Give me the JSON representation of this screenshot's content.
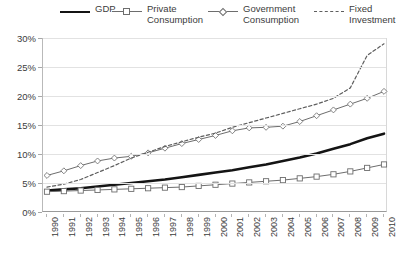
{
  "chart_data": {
    "type": "line",
    "title": "",
    "xlabel": "",
    "ylabel": "",
    "grid": true,
    "legend_position": "top",
    "ylim": [
      0,
      30
    ],
    "ytick_labels": [
      "0%",
      "5%",
      "10%",
      "15%",
      "20%",
      "25%",
      "30%"
    ],
    "ytick_values": [
      0,
      5,
      10,
      15,
      20,
      25,
      30
    ],
    "categories": [
      "1990",
      "1991",
      "1992",
      "1993",
      "1994",
      "1995",
      "1996",
      "1997",
      "1998",
      "1999",
      "2000",
      "2001",
      "2002",
      "2003",
      "2004",
      "2005",
      "2006",
      "2007",
      "2008",
      "2009",
      "2010"
    ],
    "series": [
      {
        "name": "GDP",
        "style": "solid-thick",
        "marker": "none",
        "color": "#141414",
        "values": [
          3.7,
          3.9,
          4.1,
          4.4,
          4.7,
          5.0,
          5.3,
          5.6,
          6.0,
          6.4,
          6.8,
          7.2,
          7.7,
          8.2,
          8.8,
          9.4,
          10.1,
          10.9,
          11.7,
          12.7,
          13.5
        ]
      },
      {
        "name": "Private\nConsumption",
        "style": "solid-thin",
        "marker": "square",
        "color": "#6d6d6d",
        "values": [
          3.5,
          3.6,
          3.7,
          3.8,
          3.9,
          4.0,
          4.1,
          4.2,
          4.3,
          4.5,
          4.7,
          4.9,
          5.1,
          5.3,
          5.5,
          5.8,
          6.1,
          6.5,
          7.0,
          7.6,
          8.2
        ]
      },
      {
        "name": "Government\nConsumption",
        "style": "solid-thin",
        "marker": "diamond",
        "color": "#6d6d6d",
        "values": [
          6.3,
          7.1,
          8.0,
          8.8,
          9.3,
          9.6,
          10.2,
          11.0,
          11.8,
          12.5,
          13.2,
          14.0,
          14.5,
          14.6,
          14.8,
          15.6,
          16.6,
          17.6,
          18.6,
          19.6,
          20.8
        ]
      },
      {
        "name": "Fixed\nInvestment",
        "style": "dashed",
        "marker": "none",
        "color": "#5e5e5e",
        "values": [
          4.3,
          4.8,
          5.6,
          6.8,
          8.0,
          9.3,
          10.3,
          11.3,
          12.1,
          12.9,
          13.6,
          14.6,
          15.4,
          16.2,
          17.0,
          17.8,
          18.6,
          19.6,
          21.4,
          27.0,
          29.0
        ]
      }
    ]
  },
  "legend": {
    "items": [
      {
        "label": "GDP"
      },
      {
        "label": "Private\nConsumption"
      },
      {
        "label": "Government\nConsumption"
      },
      {
        "label": "Fixed\nInvestment"
      }
    ]
  }
}
